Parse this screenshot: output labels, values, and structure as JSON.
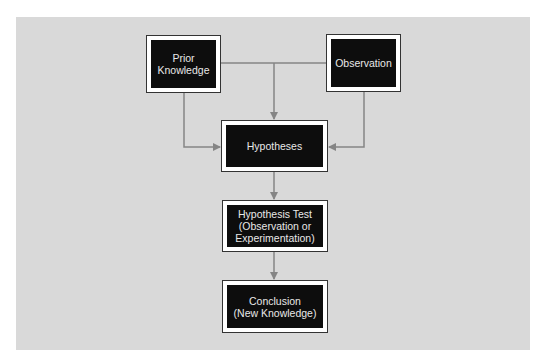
{
  "diagram": {
    "type": "flowchart",
    "colors": {
      "panel": "#d9d9d9",
      "box_fill": "#0d0d0d",
      "box_text": "#e8e8e8",
      "box_border": "#ffffff",
      "connector": "#858585"
    },
    "nodes": [
      {
        "id": "prior",
        "label": "Prior\nKnowledge"
      },
      {
        "id": "observation",
        "label": "Observation"
      },
      {
        "id": "hypotheses",
        "label": "Hypotheses"
      },
      {
        "id": "test",
        "label": "Hypothesis Test\n(Observation or\nExperimentation)"
      },
      {
        "id": "conclusion",
        "label": "Conclusion\n(New Knowledge)"
      }
    ],
    "edges": [
      {
        "from": "prior",
        "to": "hypotheses"
      },
      {
        "from": "observation",
        "to": "hypotheses"
      },
      {
        "from": "prior+observation",
        "to": "hypotheses",
        "note": "merged line into top"
      },
      {
        "from": "hypotheses",
        "to": "test"
      },
      {
        "from": "test",
        "to": "conclusion"
      }
    ]
  }
}
